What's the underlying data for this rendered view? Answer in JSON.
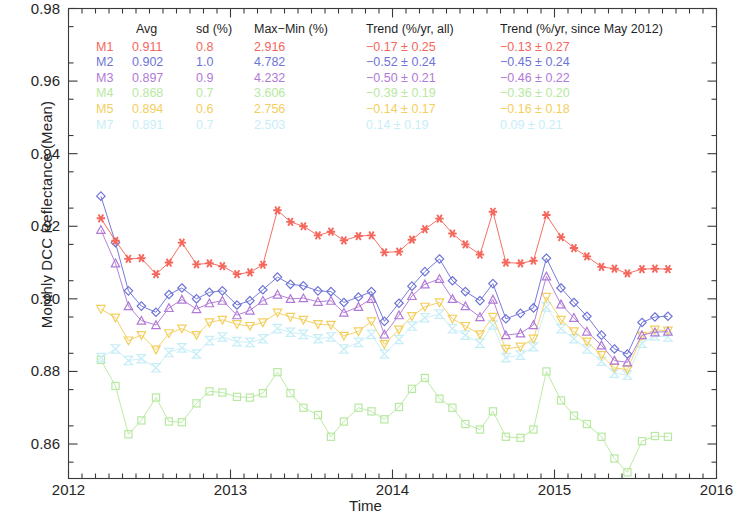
{
  "axes": {
    "ylabel": "Monthly DCC Reflectance (Mean)",
    "xlabel": "Time",
    "yticks": [
      "0.86",
      "0.88",
      "0.90",
      "0.92",
      "0.94",
      "0.96",
      "0.98"
    ],
    "xticks": [
      "2012",
      "2013",
      "2014",
      "2015",
      "2016"
    ]
  },
  "legend": {
    "headers": {
      "tag": "",
      "avg": "Avg",
      "sd": "sd (%)",
      "maxmin": "Max−Min (%)",
      "trend_all": "Trend (%/yr, all)",
      "trend_since": "Trend (%/yr, since May 2012)"
    },
    "rows": [
      {
        "tag": "M1",
        "avg": "0.911",
        "sd": "0.8",
        "maxmin": "2.916",
        "trend_all": "−0.17 ± 0.25",
        "trend_since": "−0.13 ± 0.27",
        "color": "#f4675c"
      },
      {
        "tag": "M2",
        "avg": "0.902",
        "sd": "1.0",
        "maxmin": "4.782",
        "trend_all": "−0.52 ± 0.24",
        "trend_since": "−0.45 ± 0.24",
        "color": "#6f74d6"
      },
      {
        "tag": "M3",
        "avg": "0.897",
        "sd": "0.9",
        "maxmin": "4.232",
        "trend_all": "−0.50 ± 0.21",
        "trend_since": "−0.46 ± 0.22",
        "color": "#b07ad6"
      },
      {
        "tag": "M4",
        "avg": "0.868",
        "sd": "0.7",
        "maxmin": "3.606",
        "trend_all": "−0.39 ± 0.19",
        "trend_since": "−0.36 ± 0.20",
        "color": "#b7e9a0"
      },
      {
        "tag": "M5",
        "avg": "0.894",
        "sd": "0.6",
        "maxmin": "2.756",
        "trend_all": "−0.14 ± 0.17",
        "trend_since": "−0.16 ± 0.18",
        "color": "#f3cf5e"
      },
      {
        "tag": "M7",
        "avg": "0.891",
        "sd": "0.7",
        "maxmin": "2.503",
        "trend_all": "0.14 ± 0.19",
        "trend_since": "0.09 ± 0.21",
        "color": "#c7eef7"
      }
    ]
  },
  "chart_data": {
    "type": "line",
    "title": "",
    "xlabel": "Time",
    "ylabel": "Monthly DCC Reflectance (Mean)",
    "xlim": [
      2012.0,
      2016.0
    ],
    "ylim": [
      0.8505,
      0.98
    ],
    "grid": false,
    "legend_position": "top-inside",
    "xtick_values": [
      2012,
      2013,
      2014,
      2015,
      2016
    ],
    "ytick_values": [
      0.86,
      0.88,
      0.9,
      0.92,
      0.94,
      0.96,
      0.98
    ],
    "x": [
      2012.2,
      2012.29,
      2012.37,
      2012.45,
      2012.54,
      2012.62,
      2012.7,
      2012.79,
      2012.87,
      2012.95,
      2013.04,
      2013.12,
      2013.2,
      2013.29,
      2013.37,
      2013.45,
      2013.54,
      2013.62,
      2013.7,
      2013.79,
      2013.87,
      2013.95,
      2014.04,
      2014.12,
      2014.2,
      2014.29,
      2014.37,
      2014.45,
      2014.54,
      2014.62,
      2014.7,
      2014.79,
      2014.87,
      2014.95,
      2015.04,
      2015.12,
      2015.2,
      2015.29,
      2015.37,
      2015.45,
      2015.54,
      2015.62,
      2015.7
    ],
    "series": [
      {
        "name": "M1",
        "marker": "asterisk",
        "color": "#f4675c",
        "values": [
          0.9222,
          0.916,
          0.911,
          0.9112,
          0.9068,
          0.91,
          0.9155,
          0.9095,
          0.9098,
          0.909,
          0.9068,
          0.9073,
          0.9094,
          0.9244,
          0.9212,
          0.92,
          0.9175,
          0.9185,
          0.9161,
          0.9173,
          0.9175,
          0.9128,
          0.913,
          0.9163,
          0.9192,
          0.9221,
          0.918,
          0.915,
          0.9122,
          0.924,
          0.91,
          0.9098,
          0.9105,
          0.9231,
          0.917,
          0.914,
          0.9117,
          0.9088,
          0.9083,
          0.907,
          0.9082,
          0.9083,
          0.9082
        ]
      },
      {
        "name": "M2",
        "marker": "diamond",
        "color": "#6f74d6",
        "values": [
          0.9283,
          0.9155,
          0.9022,
          0.898,
          0.8963,
          0.9012,
          0.903,
          0.9,
          0.9018,
          0.9022,
          0.8983,
          0.8995,
          0.9025,
          0.906,
          0.904,
          0.9036,
          0.9022,
          0.902,
          0.899,
          0.9005,
          0.902,
          0.8938,
          0.8988,
          0.9035,
          0.9075,
          0.911,
          0.905,
          0.902,
          0.8995,
          0.9042,
          0.8945,
          0.896,
          0.8975,
          0.9112,
          0.903,
          0.899,
          0.8952,
          0.89,
          0.8862,
          0.8848,
          0.8935,
          0.895,
          0.8952
        ]
      },
      {
        "name": "M3",
        "marker": "triangle-up",
        "color": "#b07ad6",
        "values": [
          0.919,
          0.9098,
          0.898,
          0.894,
          0.8928,
          0.8975,
          0.8998,
          0.8972,
          0.8988,
          0.8995,
          0.8955,
          0.8968,
          0.8995,
          0.9012,
          0.9,
          0.9002,
          0.8992,
          0.8995,
          0.8962,
          0.8978,
          0.9,
          0.8902,
          0.8955,
          0.9008,
          0.904,
          0.9055,
          0.9,
          0.898,
          0.895,
          0.8998,
          0.89,
          0.8905,
          0.8928,
          0.9062,
          0.8985,
          0.8948,
          0.891,
          0.8872,
          0.883,
          0.8825,
          0.89,
          0.8908,
          0.891
        ]
      },
      {
        "name": "M4",
        "marker": "square",
        "color": "#b7e9a0",
        "values": [
          0.8832,
          0.876,
          0.8627,
          0.8665,
          0.8728,
          0.8662,
          0.866,
          0.8712,
          0.8745,
          0.8742,
          0.873,
          0.8728,
          0.874,
          0.8798,
          0.874,
          0.87,
          0.868,
          0.862,
          0.8662,
          0.87,
          0.869,
          0.8668,
          0.8702,
          0.8752,
          0.8782,
          0.8725,
          0.87,
          0.8655,
          0.864,
          0.869,
          0.862,
          0.8617,
          0.864,
          0.88,
          0.872,
          0.8678,
          0.8655,
          0.862,
          0.856,
          0.8522,
          0.8608,
          0.8622,
          0.862
        ]
      },
      {
        "name": "M5",
        "marker": "triangle-down",
        "color": "#f3cf5e",
        "values": [
          0.8972,
          0.8948,
          0.8885,
          0.89,
          0.886,
          0.8905,
          0.8918,
          0.89,
          0.8935,
          0.8942,
          0.893,
          0.8925,
          0.8935,
          0.8962,
          0.895,
          0.8942,
          0.893,
          0.8928,
          0.8898,
          0.891,
          0.8938,
          0.8875,
          0.8915,
          0.8952,
          0.8978,
          0.899,
          0.8945,
          0.8925,
          0.8902,
          0.895,
          0.8862,
          0.8868,
          0.889,
          0.9005,
          0.8942,
          0.891,
          0.8882,
          0.8845,
          0.881,
          0.8805,
          0.8898,
          0.8915,
          0.8912
        ]
      },
      {
        "name": "M7",
        "marker": "bowtie",
        "color": "#c7eef7",
        "values": [
          0.8838,
          0.8862,
          0.883,
          0.8835,
          0.881,
          0.8852,
          0.8865,
          0.8848,
          0.8885,
          0.8895,
          0.8882,
          0.888,
          0.889,
          0.8918,
          0.8908,
          0.8902,
          0.889,
          0.8895,
          0.8862,
          0.888,
          0.8902,
          0.8848,
          0.8888,
          0.8925,
          0.8948,
          0.8958,
          0.8918,
          0.89,
          0.8878,
          0.8928,
          0.8838,
          0.8845,
          0.8868,
          0.8978,
          0.8918,
          0.889,
          0.8862,
          0.8828,
          0.8795,
          0.879,
          0.8878,
          0.8898,
          0.8895
        ]
      }
    ]
  }
}
